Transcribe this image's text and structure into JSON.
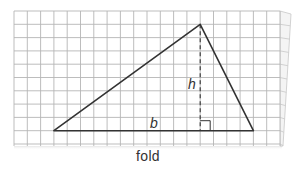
{
  "diagram": {
    "labels": {
      "base": "b",
      "height": "h",
      "fold": "fold"
    },
    "grid": {
      "columns": 20,
      "rows": 10,
      "cell_px": 13.3,
      "origin": [
        14,
        11
      ],
      "line_color": "#b5b5b5"
    },
    "triangle": {
      "vertices_grid": [
        [
          3,
          9
        ],
        [
          14,
          1
        ],
        [
          18,
          9
        ]
      ],
      "stroke_color": "#333333"
    },
    "height_line": {
      "from_grid": [
        14,
        1
      ],
      "to_grid": [
        14,
        9
      ],
      "style": "dashed"
    },
    "right_angle_marker": true
  }
}
